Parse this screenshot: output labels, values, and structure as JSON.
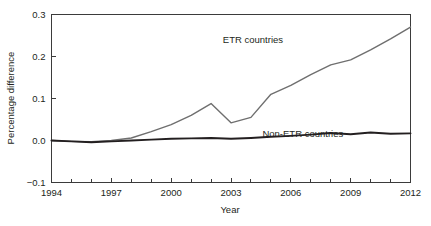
{
  "chart_data": {
    "type": "line",
    "title": "",
    "xlabel": "Year",
    "ylabel": "Percentage difference",
    "xlim": [
      1994,
      2012
    ],
    "ylim": [
      -0.1,
      0.3
    ],
    "grid": false,
    "legend_position": "inline-annotation",
    "x_tick_labels": [
      "1994",
      "1997",
      "2000",
      "2003",
      "2006",
      "2009",
      "2012"
    ],
    "x_ticks": [
      1994,
      1997,
      2000,
      2003,
      2006,
      2009,
      2012
    ],
    "x_minor_ticks": [
      1995,
      1996,
      1998,
      1999,
      2001,
      2002,
      2004,
      2005,
      2007,
      2008,
      2010,
      2011
    ],
    "y_tick_labels": [
      "0.3",
      "0.2",
      "0.1",
      "0.0",
      "−0.1"
    ],
    "y_ticks": [
      0.3,
      0.2,
      0.1,
      0.0,
      -0.1
    ],
    "x": [
      1994,
      1995,
      1996,
      1997,
      1998,
      1999,
      2000,
      2001,
      2002,
      2003,
      2004,
      2005,
      2006,
      2007,
      2008,
      2009,
      2010,
      2011,
      2012
    ],
    "series": [
      {
        "name": "ETR countries",
        "color": "#6f6f6f",
        "width": 1.4,
        "label_x": 2004.1,
        "label_y": 0.232,
        "values": [
          0.0,
          -0.002,
          -0.003,
          0.0,
          0.006,
          0.021,
          0.038,
          0.06,
          0.088,
          0.042,
          0.055,
          0.11,
          0.131,
          0.157,
          0.18,
          0.192,
          0.216,
          0.242,
          0.27
        ]
      },
      {
        "name": "Non-ETR countries",
        "color": "#231f20",
        "width": 1.9,
        "label_x": 2006.6,
        "label_y": 0.0095,
        "values": [
          0.0,
          -0.002,
          -0.004,
          -0.002,
          0.0,
          0.002,
          0.004,
          0.005,
          0.006,
          0.004,
          0.006,
          0.009,
          0.011,
          0.014,
          0.018,
          0.015,
          0.019,
          0.016,
          0.017
        ]
      }
    ]
  }
}
